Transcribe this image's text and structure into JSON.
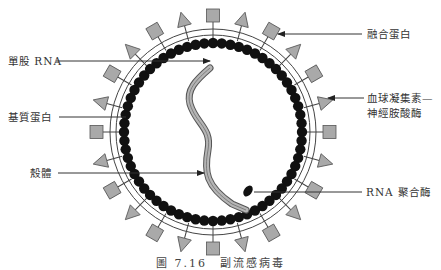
{
  "diagram": {
    "labels": {
      "ssrna": "單股 RNA",
      "matrix_protein": "基質蛋白",
      "capsid": "殼體",
      "fusion_protein": "融合蛋白",
      "hn_line1": "血球凝集素—",
      "hn_line2": "神經胺酸酶",
      "rna_polymerase": "RNA 聚合酶"
    },
    "caption": "圖 7.16　副流感病毒"
  },
  "colors": {
    "spike_fill": "#a9a9a9",
    "spike_stroke": "#555555",
    "bead_fill": "#111111",
    "line": "#444444",
    "rna_fill": "#b5b5b5"
  }
}
